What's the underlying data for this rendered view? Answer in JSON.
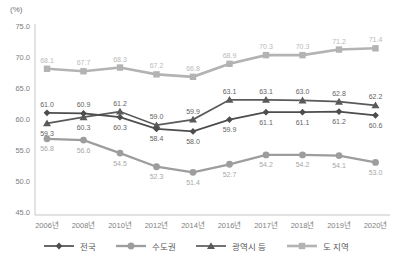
{
  "chart_data": {
    "type": "line",
    "title": "",
    "unit_label": "(%)",
    "xlabel": "",
    "ylabel": "(%)",
    "ylim": [
      45.0,
      75.0
    ],
    "grid": false,
    "legend_position": "bottom",
    "y_ticks": [
      "75.0",
      "70.0",
      "65.0",
      "60.0",
      "55.0",
      "50.0",
      "45.0"
    ],
    "categories": [
      "2006년",
      "2008년",
      "2010년",
      "2012년",
      "2014년",
      "2016년",
      "2017년",
      "2018년",
      "2019년",
      "2020년"
    ],
    "series": [
      {
        "name": "전국",
        "marker": "diamond",
        "color": "#4d4d4d",
        "label_color": "#646464",
        "line_width": 1.7,
        "values": [
          61.0,
          60.9,
          60.3,
          58.4,
          58.0,
          59.9,
          61.1,
          61.1,
          61.2,
          60.6
        ],
        "label_side": [
          "above",
          "above",
          "below",
          "below",
          "below",
          "below",
          "below",
          "below",
          "below",
          "below"
        ]
      },
      {
        "name": "수도권",
        "marker": "circle",
        "color": "#9d9d9d",
        "label_color": "#a8a8a8",
        "line_width": 2.3,
        "values": [
          56.8,
          56.6,
          54.5,
          52.3,
          51.4,
          52.7,
          54.2,
          54.2,
          54.1,
          53.0
        ],
        "label_side": [
          "below",
          "below",
          "below",
          "below",
          "below",
          "below",
          "below",
          "below",
          "below",
          "below"
        ]
      },
      {
        "name": "광역시 등",
        "marker": "triangle",
        "color": "#5a5a5a",
        "label_color": "#646464",
        "line_width": 1.7,
        "values": [
          59.3,
          60.3,
          61.2,
          59.0,
          59.9,
          63.1,
          63.1,
          63.0,
          62.8,
          62.2
        ],
        "label_side": [
          "below",
          "below",
          "above",
          "above",
          "above",
          "above",
          "above",
          "above",
          "above",
          "above"
        ]
      },
      {
        "name": "도 지역",
        "marker": "square",
        "color": "#b3b3b3",
        "label_color": "#b9b9b9",
        "line_width": 2.6,
        "values": [
          68.1,
          67.7,
          68.3,
          67.2,
          66.8,
          68.9,
          70.3,
          70.3,
          71.2,
          71.4
        ],
        "label_side": [
          "above",
          "above",
          "above",
          "above",
          "above",
          "above",
          "above",
          "above",
          "above",
          "above"
        ]
      }
    ],
    "axis_color": "#c6c6c6",
    "tick_label_color": "#808080"
  }
}
